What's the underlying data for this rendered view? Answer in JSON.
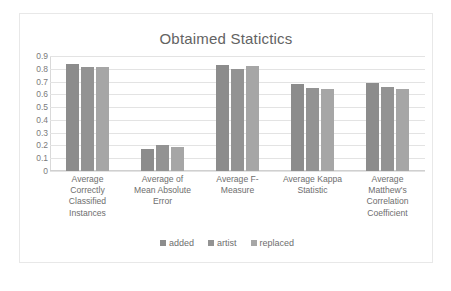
{
  "chart_data": {
    "type": "bar",
    "title": "Obtaimed Statictics",
    "xlabel": "",
    "ylabel": "",
    "ylim": [
      0,
      0.9
    ],
    "grid": true,
    "legend_position": "bottom",
    "y_ticks": [
      "0.9",
      "0.8",
      "0.7",
      "0.6",
      "0.5",
      "0.4",
      "0.3",
      "0.2",
      "0.1",
      "0"
    ],
    "y_tick_values": [
      0.9,
      0.8,
      0.7,
      0.6,
      0.5,
      0.4,
      0.3,
      0.2,
      0.1,
      0
    ],
    "categories": [
      "Average Correctly Classified Instances",
      "Average of Mean Absolute Error",
      "Average F-Measure",
      "Average Kappa Statistic",
      "Average Matthew's Correlation Coefficient"
    ],
    "category_lines": [
      [
        "Average",
        "Correctly",
        "Classified",
        "Instances"
      ],
      [
        "Average of",
        "Mean Absolute",
        "Error"
      ],
      [
        "Average F-",
        "Measure"
      ],
      [
        "Average Kappa",
        "Statistic"
      ],
      [
        "Average",
        "Matthew's",
        "Correlation",
        "Coefficient"
      ]
    ],
    "series": [
      {
        "name": "added",
        "color": "#8c8c8c",
        "values": [
          0.835,
          0.172,
          0.83,
          0.68,
          0.685
        ]
      },
      {
        "name": "artist",
        "color": "#939393",
        "values": [
          0.815,
          0.205,
          0.8,
          0.65,
          0.655
        ]
      },
      {
        "name": "replaced",
        "color": "#a6a6a6",
        "values": [
          0.815,
          0.19,
          0.825,
          0.645,
          0.645
        ]
      }
    ]
  },
  "colors": {
    "frame_border": "#e8e8e8",
    "gridline": "#e3e3e3",
    "title_text": "#636363",
    "label_text": "#6e6e6e",
    "background": "#ffffff"
  }
}
